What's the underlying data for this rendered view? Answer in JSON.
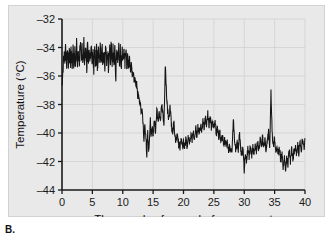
{
  "figure": {
    "caption_label": "B.",
    "panel_background": "#e9e9e9",
    "line_color": "#151515",
    "axis_color": "#1a1a1a",
    "grid_color": "#cfcfcf"
  },
  "chart_data": {
    "type": "line",
    "title": "",
    "xlabel": "Thousands of years before present",
    "ylabel": "Temperature (°C)",
    "xlim": [
      0,
      40
    ],
    "ylim": [
      -44,
      -32
    ],
    "xticks": [
      0,
      5,
      10,
      15,
      20,
      25,
      30,
      35,
      40
    ],
    "yticks": [
      -32,
      -34,
      -36,
      -38,
      -40,
      -42,
      -44
    ],
    "xtick_labels": [
      "0",
      "5",
      "10",
      "15",
      "20",
      "25",
      "30",
      "35",
      "40"
    ],
    "ytick_labels": [
      "–32",
      "–34",
      "–36",
      "–38",
      "–40",
      "–42",
      "–44"
    ],
    "grid": true,
    "legend": null,
    "series": [
      {
        "name": "Ice core temperature",
        "x": [
          0.0,
          0.15,
          0.3,
          0.45,
          0.6,
          0.75,
          0.9,
          1.05,
          1.2,
          1.35,
          1.5,
          1.65,
          1.8,
          1.95,
          2.1,
          2.25,
          2.4,
          2.55,
          2.7,
          2.85,
          3.0,
          3.15,
          3.3,
          3.45,
          3.6,
          3.75,
          3.9,
          4.05,
          4.2,
          4.35,
          4.5,
          4.65,
          4.8,
          4.95,
          5.1,
          5.25,
          5.4,
          5.55,
          5.7,
          5.85,
          6.0,
          6.15,
          6.3,
          6.45,
          6.6,
          6.75,
          6.9,
          7.05,
          7.2,
          7.35,
          7.5,
          7.65,
          7.8,
          7.95,
          8.1,
          8.25,
          8.4,
          8.55,
          8.7,
          8.85,
          9.0,
          9.15,
          9.3,
          9.45,
          9.6,
          9.75,
          9.9,
          10.05,
          10.2,
          10.35,
          10.5,
          10.65,
          10.8,
          10.95,
          11.1,
          11.25,
          11.4,
          11.55,
          11.7,
          11.85,
          12.0,
          12.15,
          12.3,
          12.45,
          12.6,
          12.75,
          12.9,
          13.05,
          13.2,
          13.35,
          13.5,
          13.65,
          13.8,
          13.95,
          14.1,
          14.25,
          14.4,
          14.55,
          14.7,
          14.85,
          15.0,
          15.2,
          15.4,
          15.6,
          15.8,
          16.0,
          16.2,
          16.4,
          16.6,
          16.8,
          17.0,
          17.2,
          17.4,
          17.6,
          17.8,
          18.0,
          18.2,
          18.4,
          18.6,
          18.8,
          19.0,
          19.2,
          19.4,
          19.6,
          19.8,
          20.0,
          20.2,
          20.4,
          20.6,
          20.8,
          21.0,
          21.2,
          21.4,
          21.6,
          21.8,
          22.0,
          22.2,
          22.4,
          22.6,
          22.8,
          23.0,
          23.2,
          23.4,
          23.6,
          23.8,
          24.0,
          24.2,
          24.4,
          24.6,
          24.8,
          25.0,
          25.2,
          25.4,
          25.6,
          25.8,
          26.0,
          26.2,
          26.4,
          26.6,
          26.8,
          27.0,
          27.2,
          27.4,
          27.6,
          27.8,
          28.0,
          28.2,
          28.4,
          28.6,
          28.8,
          29.0,
          29.2,
          29.4,
          29.6,
          29.8,
          30.0,
          30.2,
          30.4,
          30.6,
          30.8,
          31.0,
          31.2,
          31.4,
          31.6,
          31.8,
          32.0,
          32.2,
          32.4,
          32.6,
          32.8,
          33.0,
          33.2,
          33.4,
          33.6,
          33.8,
          34.0,
          34.2,
          34.4,
          34.6,
          34.8,
          35.0,
          35.2,
          35.4,
          35.6,
          35.8,
          36.0,
          36.2,
          36.4,
          36.6,
          36.8,
          37.0,
          37.2,
          37.4,
          37.6,
          37.8,
          38.0,
          38.2,
          38.4,
          38.6,
          38.8,
          39.0,
          39.2,
          39.4,
          39.6,
          39.8,
          40.0
        ],
        "y": [
          -36.3,
          -35.4,
          -34.6,
          -35.2,
          -34.2,
          -35.3,
          -34.5,
          -35.4,
          -34.3,
          -35.2,
          -34.4,
          -35.3,
          -34.0,
          -35.1,
          -34.3,
          -35.4,
          -33.9,
          -35.0,
          -34.2,
          -35.3,
          -33.6,
          -34.8,
          -34.0,
          -35.2,
          -33.8,
          -35.0,
          -34.2,
          -35.4,
          -34.0,
          -35.2,
          -34.1,
          -35.0,
          -33.8,
          -35.2,
          -34.3,
          -35.5,
          -34.2,
          -35.3,
          -34.0,
          -35.4,
          -34.2,
          -35.2,
          -34.1,
          -35.4,
          -34.0,
          -35.1,
          -34.3,
          -35.4,
          -34.0,
          -35.2,
          -34.2,
          -35.5,
          -33.9,
          -35.0,
          -33.6,
          -35.1,
          -34.2,
          -35.4,
          -34.0,
          -36.1,
          -34.3,
          -35.0,
          -33.7,
          -34.9,
          -34.2,
          -35.2,
          -34.3,
          -34.8,
          -34.4,
          -35.0,
          -34.6,
          -35.1,
          -34.5,
          -35.3,
          -34.8,
          -35.6,
          -35.2,
          -35.9,
          -35.6,
          -36.3,
          -36.0,
          -36.8,
          -36.5,
          -37.4,
          -37.2,
          -38.0,
          -37.8,
          -38.6,
          -38.4,
          -39.6,
          -40.6,
          -39.4,
          -40.3,
          -41.6,
          -40.0,
          -41.2,
          -40.6,
          -39.0,
          -40.4,
          -39.6,
          -40.3,
          -39.1,
          -40.0,
          -38.3,
          -39.0,
          -38.6,
          -39.4,
          -37.9,
          -38.8,
          -39.3,
          -35.1,
          -37.3,
          -38.5,
          -39.0,
          -38.2,
          -39.3,
          -40.1,
          -39.2,
          -40.3,
          -40.7,
          -40.0,
          -40.8,
          -41.0,
          -40.4,
          -41.1,
          -40.6,
          -41.0,
          -40.4,
          -40.9,
          -40.3,
          -40.7,
          -40.0,
          -40.5,
          -39.8,
          -40.3,
          -39.6,
          -40.2,
          -39.5,
          -40.0,
          -39.4,
          -39.8,
          -39.2,
          -39.6,
          -39.0,
          -39.5,
          -38.7,
          -39.4,
          -39.0,
          -39.6,
          -39.2,
          -39.8,
          -39.3,
          -40.0,
          -39.6,
          -40.3,
          -39.9,
          -40.6,
          -40.2,
          -40.8,
          -40.5,
          -41.0,
          -40.7,
          -41.2,
          -40.9,
          -41.4,
          -41.0,
          -39.2,
          -40.4,
          -41.3,
          -40.6,
          -41.2,
          -40.0,
          -41.0,
          -41.6,
          -40.8,
          -42.6,
          -41.4,
          -42.0,
          -41.0,
          -41.8,
          -40.9,
          -41.6,
          -41.0,
          -41.4,
          -40.8,
          -41.3,
          -40.6,
          -41.2,
          -40.5,
          -41.0,
          -40.3,
          -41.1,
          -40.4,
          -41.2,
          -40.6,
          -40.0,
          -41.0,
          -37.0,
          -40.2,
          -41.0,
          -40.4,
          -41.4,
          -40.8,
          -41.6,
          -41.0,
          -42.0,
          -41.4,
          -42.4,
          -41.6,
          -42.6,
          -41.8,
          -42.2,
          -41.2,
          -42.0,
          -41.0,
          -41.8,
          -41.2,
          -41.0,
          -41.5,
          -40.8,
          -41.4,
          -40.6,
          -41.2,
          -40.4,
          -41.0,
          -40.6
        ]
      }
    ]
  }
}
